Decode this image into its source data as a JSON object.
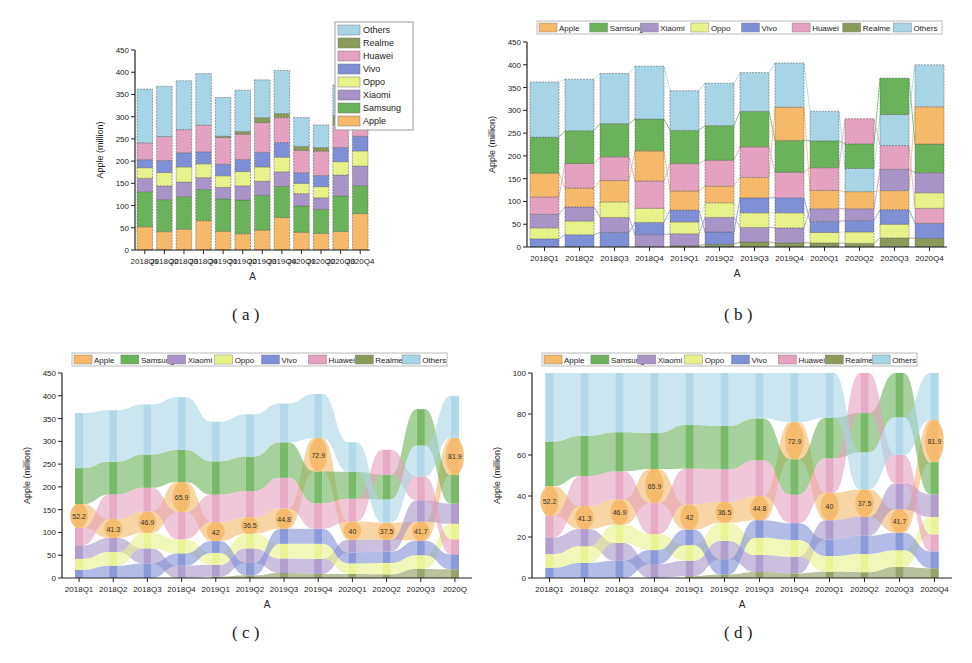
{
  "figure": {
    "captions": [
      "( a )",
      "( b )",
      "( c )",
      "( d )"
    ]
  },
  "legend_colors": {
    "Apple": "#f5b969",
    "Samsung": "#6ab35a",
    "Xiaomi": "#a994c8",
    "Oppo": "#e8f28a",
    "Vivo": "#7f8fd6",
    "Huawei": "#e4a2c0",
    "Realme": "#8a9a5b",
    "Others": "#a8d5e5"
  },
  "chart_data": [
    {
      "id": "a",
      "type": "bar",
      "stacked": true,
      "stack_order": "fixed",
      "title": "",
      "xlabel": "A",
      "ylabel": "Apple (million)",
      "ylim": [
        0,
        450
      ],
      "yticks": [
        0,
        50,
        100,
        150,
        200,
        250,
        300,
        350,
        400,
        450
      ],
      "grid": false,
      "legend_position": "upper right (vertical, top-to-bottom reversed)",
      "legend": [
        "Others",
        "Realme",
        "Huawei",
        "Vivo",
        "Oppo",
        "Xiaomi",
        "Samsung",
        "Apple"
      ],
      "categories": [
        "2018Q1",
        "2018Q2",
        "2018Q3",
        "2018Q4",
        "2019Q1",
        "2019Q2",
        "2019Q3",
        "2019Q4",
        "2020Q1",
        "2020Q2",
        "2020Q3",
        "2020Q4"
      ],
      "series": [
        {
          "name": "Apple",
          "values": [
            52.2,
            41.3,
            46.9,
            65.9,
            42,
            36.5,
            44.8,
            72.9,
            40,
            37.5,
            41.7,
            81.9
          ]
        },
        {
          "name": "Samsung",
          "values": [
            79,
            72,
            73,
            70,
            73,
            76,
            78,
            70,
            59,
            54,
            80,
            63
          ]
        },
        {
          "name": "Xiaomi",
          "values": [
            30,
            31,
            33,
            27,
            26,
            32,
            32,
            33,
            28,
            26,
            47,
            44
          ]
        },
        {
          "name": "Oppo",
          "values": [
            24,
            30,
            34,
            31,
            26,
            32,
            32,
            33,
            23,
            25,
            30,
            34
          ]
        },
        {
          "name": "Vivo",
          "values": [
            18,
            27,
            32,
            27,
            26,
            27,
            33,
            33,
            24,
            25,
            32,
            33
          ]
        },
        {
          "name": "Huawei",
          "values": [
            38,
            54,
            52,
            60,
            60,
            57,
            67,
            56,
            50,
            55,
            52,
            33
          ]
        },
        {
          "name": "Realme",
          "values": [
            0,
            0,
            0,
            0,
            3,
            6,
            11,
            9,
            9,
            8,
            20,
            19
          ]
        },
        {
          "name": "Others",
          "values": [
            121,
            113,
            110,
            116,
            87,
            93,
            85,
            97,
            65,
            51,
            68,
            92
          ]
        }
      ]
    },
    {
      "id": "b",
      "type": "bar",
      "stacked": true,
      "stack_order": "ascending per category (smallest at bottom), with connector lines between bars",
      "xlabel": "A",
      "ylabel": "Apple (million)",
      "ylim": [
        0,
        450
      ],
      "yticks": [
        0,
        50,
        100,
        150,
        200,
        250,
        300,
        350,
        400,
        450
      ],
      "grid": false,
      "legend_position": "top (horizontal)",
      "legend": [
        "Apple",
        "Samsung",
        "Xiaomi",
        "Oppo",
        "Vivo",
        "Huawei",
        "Realme",
        "Others"
      ],
      "categories": [
        "2018Q1",
        "2018Q2",
        "2018Q3",
        "2018Q4",
        "2019Q1",
        "2019Q2",
        "2019Q3",
        "2019Q4",
        "2020Q1",
        "2020Q2",
        "2020Q3",
        "2020Q4"
      ],
      "series_ref": "a"
    },
    {
      "id": "c",
      "type": "area",
      "subtype": "ribbon / sorted stream chart",
      "xlabel": "A",
      "ylabel": "Apple (million)",
      "ylim": [
        0,
        450
      ],
      "yticks": [
        0,
        50,
        100,
        150,
        200,
        250,
        300,
        350,
        400,
        450
      ],
      "grid": false,
      "legend_position": "top (horizontal)",
      "legend": [
        "Apple",
        "Samsung",
        "Xiaomi",
        "Oppo",
        "Vivo",
        "Huawei",
        "Realme",
        "Others"
      ],
      "categories": [
        "2018Q1",
        "2018Q2",
        "2018Q3",
        "2018Q4",
        "2019Q1",
        "2019Q2",
        "2019Q3",
        "2019Q4",
        "2020Q1",
        "2020Q2",
        "2020Q3",
        "2020Q"
      ],
      "annotations": [
        "52.2",
        "41.3",
        "46.9",
        "65.9",
        "42",
        "36.5",
        "44.8",
        "72.9",
        "40",
        "37.5",
        "41.7",
        "81.9"
      ],
      "series_ref": "a"
    },
    {
      "id": "d",
      "type": "area",
      "subtype": "ribbon / sorted stream chart, normalized to 100%",
      "xlabel": "A",
      "ylabel": "Apple (million)",
      "ylim": [
        0,
        100
      ],
      "yticks": [
        0,
        20,
        40,
        60,
        80,
        100
      ],
      "grid": false,
      "legend_position": "top (horizontal)",
      "legend": [
        "Apple",
        "Samsung",
        "Xiaomi",
        "Oppo",
        "Vivo",
        "Huawei",
        "Realme",
        "Others"
      ],
      "categories": [
        "2018Q1",
        "2018Q2",
        "2018Q3",
        "2018Q4",
        "2019Q1",
        "2019Q2",
        "2019Q3",
        "2019Q4",
        "2020Q1",
        "2020Q2",
        "2020Q3",
        "2020Q4"
      ],
      "annotations": [
        "52.2",
        "41.3",
        "46.9",
        "65.9",
        "42",
        "36.5",
        "44.8",
        "72.9",
        "40",
        "37.5",
        "41.7",
        "81.9"
      ],
      "series_ref": "a"
    }
  ]
}
